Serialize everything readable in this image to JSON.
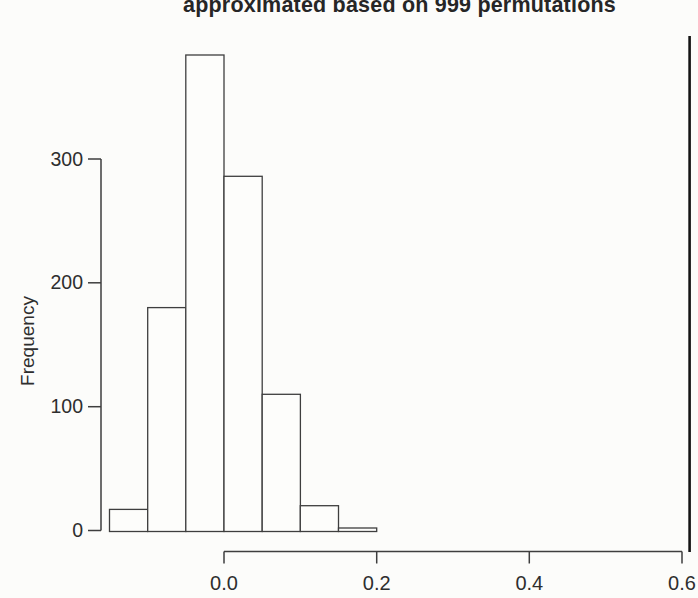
{
  "chart_data": {
    "type": "bar",
    "subtype": "histogram",
    "title": "approximated based on 999 permutations",
    "title_note": "title line partially cut off at top edge of image",
    "xlabel": "",
    "ylabel": "Frequency",
    "bin_edges": [
      -0.15,
      -0.1,
      -0.05,
      0.0,
      0.05,
      0.1,
      0.15,
      0.2
    ],
    "series": [
      {
        "name": "permutation frequencies",
        "values": [
          17,
          180,
          384,
          286,
          110,
          20,
          2
        ]
      }
    ],
    "total_permutations": 999,
    "x_ticks": [
      "0.0",
      "0.2",
      "0.4",
      "0.6"
    ],
    "x_tick_values": [
      0.0,
      0.2,
      0.4,
      0.6
    ],
    "y_ticks": [
      "0",
      "100",
      "200",
      "300"
    ],
    "y_tick_values": [
      0,
      100,
      200,
      300
    ],
    "xlim": [
      -0.16,
      0.62
    ],
    "ylim": [
      0,
      400
    ],
    "grid": false,
    "legend": "none",
    "annotations": [
      {
        "type": "vline",
        "x": 0.61,
        "meaning": "observed statistic"
      }
    ],
    "colors": {
      "background": "#fcfcfa",
      "bar_fill": "#fdfdfb",
      "bar_stroke": "#3e3e3e",
      "axis": "#3e3e3e",
      "tick_text": "#2e2e2e",
      "observed_line": "#141414"
    }
  }
}
